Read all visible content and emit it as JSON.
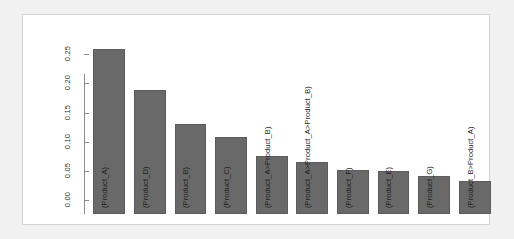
{
  "chart_data": {
    "type": "bar",
    "title": "",
    "subtitle": "",
    "xlabel": "",
    "ylabel": "",
    "grid": false,
    "legend": null,
    "orientation": "vertical",
    "bar_label_rotation_deg": 90,
    "tick_label_rotation_deg": 90,
    "ylim": [
      0.0,
      0.29
    ],
    "yticks": [
      "0.00",
      "0.05",
      "0.10",
      "0.15",
      "0.20",
      "0.25"
    ],
    "ytick_values": [
      0.0,
      0.05,
      0.1,
      0.15,
      0.2,
      0.25
    ],
    "categories": [
      "(Product_A)",
      "(Product_D)",
      "(Product_B)",
      "(Product_C)",
      "(Product_A>Product_B)",
      "(Product_A>Product_A>Product_B)",
      "(Product_F)",
      "(Product_E)",
      "(Product_G)",
      "(Product_B>Product_A)"
    ],
    "values": [
      0.283,
      0.212,
      0.155,
      0.133,
      0.099,
      0.089,
      0.075,
      0.073,
      0.065,
      0.056
    ],
    "colors": {
      "bar_fill": "#696969",
      "bar_border": "#5c5c5c",
      "axis": "#8c8c8c",
      "text": "#1f1f1f",
      "panel_background": "#ffffff",
      "panel_border": "#d4d4d4",
      "page_background": "#f1f1f1"
    }
  }
}
